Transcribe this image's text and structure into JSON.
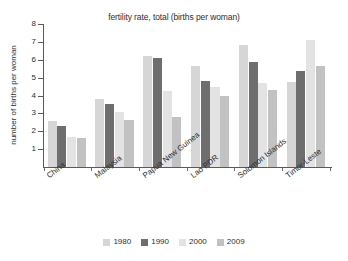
{
  "chart_data": {
    "type": "bar",
    "title": "fertility rate, total (births per woman)",
    "xlabel": "",
    "ylabel": "number of births per woman",
    "ylim": [
      0,
      8
    ],
    "yticks": [
      1,
      2,
      3,
      4,
      5,
      6,
      7,
      8
    ],
    "grid": false,
    "legend_position": "bottom",
    "categories": [
      "China",
      "Malaysia",
      "Papua New Guinea",
      "Lao PDR",
      "Solomon Islands",
      "Timor-Leste"
    ],
    "series": [
      {
        "name": "1980",
        "color": "#d6d6d6",
        "values": [
          2.6,
          3.8,
          6.2,
          5.65,
          6.8,
          4.75
        ]
      },
      {
        "name": "1990",
        "color": "#6e6e6e",
        "values": [
          2.3,
          3.5,
          6.1,
          4.8,
          5.85,
          5.35
        ]
      },
      {
        "name": "2000",
        "color": "#e3e3e3",
        "values": [
          1.7,
          3.1,
          4.25,
          4.5,
          4.7,
          7.1
        ]
      },
      {
        "name": "2009",
        "color": "#c2c2c2",
        "values": [
          1.6,
          2.65,
          2.8,
          4.0,
          4.3,
          5.65
        ]
      }
    ]
  },
  "legend": {
    "items": [
      {
        "label": "1980",
        "color": "#d6d6d6"
      },
      {
        "label": "1990",
        "color": "#6e6e6e"
      },
      {
        "label": "2000",
        "color": "#e3e3e3"
      },
      {
        "label": "2009",
        "color": "#c2c2c2"
      }
    ]
  },
  "axis": {
    "y_tick_labels": [
      "8",
      "7",
      "6",
      "5",
      "4",
      "3",
      "2",
      "1"
    ]
  }
}
